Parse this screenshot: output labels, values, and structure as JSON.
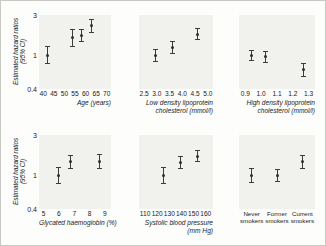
{
  "figure": {
    "y_axis": {
      "title": "Estimated hazard ratios (95% CI)",
      "title_line1": "Estimated hazard ratios",
      "title_line2": "(95% CI)",
      "ticks": [
        "3",
        "1",
        "0.4"
      ],
      "tick_values": [
        3,
        1,
        0.4
      ],
      "scale": "log",
      "ylim": [
        0.4,
        3
      ]
    }
  },
  "chart_data": [
    {
      "type": "scatter",
      "panel": "age",
      "title": "",
      "xlabel": "Age (years)",
      "ylabel": "Estimated hazard ratios (95% CI)",
      "xlim": [
        38,
        72
      ],
      "ylim": [
        0.4,
        3
      ],
      "xticks": [
        40,
        45,
        50,
        55,
        60,
        65,
        70
      ],
      "xtick_labels": [
        "40",
        "45",
        "50",
        "55",
        "60",
        "65",
        "70"
      ],
      "grid": false,
      "x": [
        42,
        54,
        58,
        63
      ],
      "values": [
        1.0,
        1.62,
        1.7,
        2.25
      ],
      "ci_low": [
        0.78,
        1.26,
        1.42,
        1.85
      ],
      "ci_high": [
        1.3,
        2.05,
        2.03,
        2.72
      ]
    },
    {
      "type": "scatter",
      "panel": "ldl-cholesterol",
      "title": "",
      "xlabel": "Low density lipoprotein cholesterol (mmol/l)",
      "xlabel_line1": "Low density lipoprotein",
      "xlabel_line2": "cholesterol (mmol/l)",
      "ylabel": "Estimated hazard ratios (95% CI)",
      "xlim": [
        2.3,
        5.2
      ],
      "ylim": [
        0.4,
        3
      ],
      "xticks": [
        2.5,
        3.0,
        3.5,
        4.0,
        4.5,
        5.0
      ],
      "xtick_labels": [
        "2.5",
        "3.0",
        "3.5",
        "4.0",
        "4.5",
        "5.0"
      ],
      "grid": false,
      "x": [
        2.95,
        3.6,
        4.6
      ],
      "values": [
        1.0,
        1.25,
        1.78
      ],
      "ci_low": [
        0.83,
        1.05,
        1.5
      ],
      "ci_high": [
        1.2,
        1.48,
        2.1
      ]
    },
    {
      "type": "scatter",
      "panel": "hdl-cholesterol",
      "title": "",
      "xlabel": "High density lipoprotein cholesterol (mmol/l)",
      "xlabel_line1": "High density lipoprotein",
      "xlabel_line2": "cholesterol (mmol/l)",
      "ylabel": "Estimated hazard ratios (95% CI)",
      "xlim": [
        0.86,
        1.34
      ],
      "ylim": [
        0.4,
        3
      ],
      "xticks": [
        0.9,
        1.0,
        1.1,
        1.2,
        1.3
      ],
      "xtick_labels": [
        "0.9",
        "1.0",
        "1.1",
        "1.2",
        "1.3"
      ],
      "grid": false,
      "x": [
        0.94,
        1.03,
        1.27
      ],
      "values": [
        1.0,
        0.97,
        0.68
      ],
      "ci_low": [
        0.86,
        0.82,
        0.56
      ],
      "ci_high": [
        1.17,
        1.14,
        0.82
      ]
    },
    {
      "type": "scatter",
      "panel": "glycated-haemoglobin",
      "title": "",
      "xlabel": "Glycated haemoglobin (%)",
      "ylabel": "Estimated hazard ratios (95% CI)",
      "xlim": [
        4.7,
        9.4
      ],
      "ylim": [
        0.4,
        3
      ],
      "xticks": [
        5,
        6,
        7,
        8,
        9
      ],
      "xtick_labels": [
        "5",
        "6",
        "7",
        "8",
        "9"
      ],
      "grid": false,
      "x": [
        6.0,
        6.75,
        8.65
      ],
      "values": [
        1.0,
        1.45,
        1.45
      ],
      "ci_low": [
        0.8,
        1.2,
        1.2
      ],
      "ci_high": [
        1.25,
        1.76,
        1.78
      ]
    },
    {
      "type": "scatter",
      "panel": "systolic-blood-pressure",
      "title": "",
      "xlabel": "Systolic blood pressure (mm Hg)",
      "xlabel_line1": "Systolic blood pressure",
      "xlabel_line2": "(mm Hg)",
      "ylabel": "Estimated hazard ratios (95% CI)",
      "xlim": [
        105,
        166
      ],
      "ylim": [
        0.4,
        3
      ],
      "xticks": [
        110,
        120,
        130,
        140,
        150,
        160
      ],
      "xtick_labels": [
        "110",
        "120",
        "130",
        "140",
        "150",
        "160"
      ],
      "grid": false,
      "x": [
        125,
        139,
        153
      ],
      "values": [
        1.0,
        1.42,
        1.68
      ],
      "ci_low": [
        0.8,
        1.2,
        1.42
      ],
      "ci_high": [
        1.24,
        1.7,
        2.0
      ]
    },
    {
      "type": "scatter",
      "panel": "smoking-status",
      "title": "",
      "xlabel": "",
      "ylabel": "Estimated hazard ratios (95% CI)",
      "ylim": [
        0.4,
        3
      ],
      "grid": false,
      "categories": [
        "Never smokers",
        "Former smokers",
        "Current smokers"
      ],
      "category_labels_line1": [
        "Never",
        "Former",
        "Current"
      ],
      "category_labels_line2": [
        "smokers",
        "smokers",
        "smokers"
      ],
      "values": [
        1.0,
        1.0,
        1.45
      ],
      "ci_low": [
        0.82,
        0.84,
        1.2
      ],
      "ci_high": [
        1.22,
        1.2,
        1.76
      ]
    }
  ]
}
